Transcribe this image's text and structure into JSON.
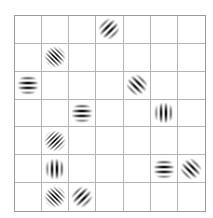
{
  "grid": {
    "rows": 7,
    "cols": 7,
    "line_color": "#b4b4b4",
    "border_color": "#9a9a9a"
  },
  "patches": [
    {
      "row": 0,
      "col": 3,
      "orientation": "diagonal-right",
      "angle": 45,
      "frequency": "medium"
    },
    {
      "row": 1,
      "col": 1,
      "orientation": "diagonal-left",
      "angle": 135,
      "frequency": "fine"
    },
    {
      "row": 2,
      "col": 0,
      "orientation": "horizontal",
      "angle": 0,
      "frequency": "medium"
    },
    {
      "row": 2,
      "col": 4,
      "orientation": "diagonal-left",
      "angle": 135,
      "frequency": "medium"
    },
    {
      "row": 3,
      "col": 2,
      "orientation": "horizontal",
      "angle": 0,
      "frequency": "medium"
    },
    {
      "row": 3,
      "col": 5,
      "orientation": "vertical",
      "angle": 90,
      "frequency": "medium"
    },
    {
      "row": 4,
      "col": 1,
      "orientation": "diagonal-right",
      "angle": 45,
      "frequency": "fine"
    },
    {
      "row": 5,
      "col": 1,
      "orientation": "vertical",
      "angle": 90,
      "frequency": "medium"
    },
    {
      "row": 5,
      "col": 5,
      "orientation": "horizontal",
      "angle": 0,
      "frequency": "medium"
    },
    {
      "row": 5,
      "col": 6,
      "orientation": "diagonal-left",
      "angle": 135,
      "frequency": "medium"
    },
    {
      "row": 6,
      "col": 1,
      "orientation": "diagonal-left",
      "angle": 135,
      "frequency": "fine"
    },
    {
      "row": 6,
      "col": 2,
      "orientation": "diagonal-right",
      "angle": 45,
      "frequency": "medium"
    }
  ]
}
